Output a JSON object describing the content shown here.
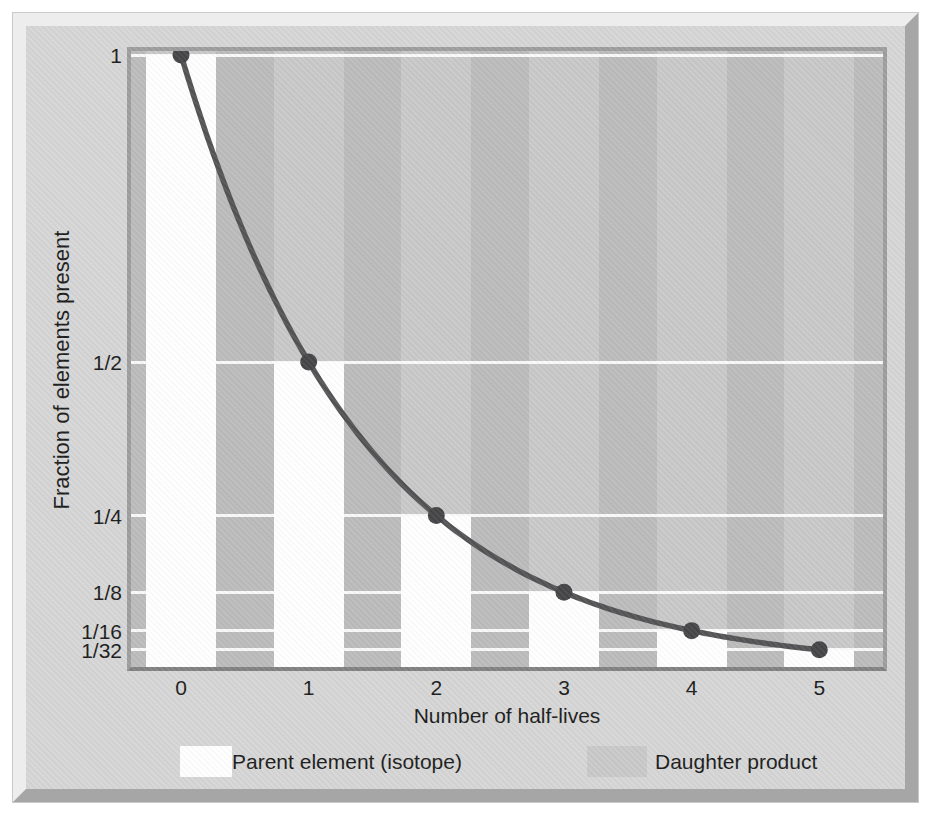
{
  "figure": {
    "kind": "textbook-figure"
  },
  "chart_data": {
    "type": "bar",
    "title": "",
    "xlabel": "Number of half-lives",
    "ylabel": "Fraction of elements present",
    "categories": [
      "0",
      "1",
      "2",
      "3",
      "4",
      "5"
    ],
    "ylim": [
      0,
      1
    ],
    "y_ticks": [
      {
        "label": "1",
        "value": 1
      },
      {
        "label": "1/2",
        "value": 0.5
      },
      {
        "label": "1/4",
        "value": 0.25
      },
      {
        "label": "1/8",
        "value": 0.125
      },
      {
        "label": "1/16",
        "value": 0.0625
      },
      {
        "label": "1/32",
        "value": 0.03125
      }
    ],
    "series": [
      {
        "name": "Parent element (isotope)",
        "values": [
          1,
          0.5,
          0.25,
          0.125,
          0.0625,
          0.03125
        ],
        "value_labels": [
          "1",
          "1/2",
          "1/4",
          "1/8",
          "1/16",
          "1/32"
        ],
        "color": "#ffffff"
      },
      {
        "name": "Daughter product",
        "values": [
          0,
          0.5,
          0.75,
          0.875,
          0.9375,
          0.96875
        ],
        "value_labels": [
          "0",
          "1/2",
          "3/4",
          "7/8",
          "15/16",
          "31/32"
        ],
        "color": "#c9c9c9"
      }
    ],
    "curve": {
      "name": "decay-curve",
      "formula": "y = (1/2)^x",
      "x_points": [
        0,
        1,
        2,
        3,
        4,
        5
      ],
      "y_points": [
        1,
        0.5,
        0.25,
        0.125,
        0.0625,
        0.03125
      ],
      "color": "#545456",
      "point_color": "#464648"
    },
    "grid": "horizontal white lines at each labeled fraction",
    "legend_position": "bottom"
  },
  "legend": {
    "items": [
      {
        "label": "Parent element (isotope)",
        "swatch_color": "#ffffff"
      },
      {
        "label": "Daughter product",
        "swatch_color": "#c9c9c9"
      }
    ]
  },
  "colors": {
    "page": "#ffffff",
    "plate_face": "#d6d6d6",
    "plate_bevel_light": "#ededed",
    "plate_bevel_dark": "#a6a6a6",
    "separator_stripe": "#bcbcbc",
    "column_stripe": "#c9c9c9",
    "plot_border": "#9e9e9e",
    "gridline": "#ffffff",
    "curve": "#545456",
    "text": "#1c1c1c"
  }
}
